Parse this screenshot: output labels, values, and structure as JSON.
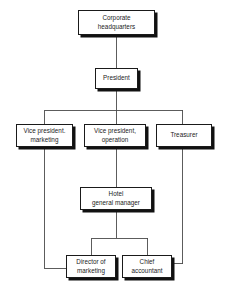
{
  "diagram": {
    "type": "org-chart",
    "background_color": "#ffffff",
    "box_fill_color": "#ffffff",
    "box_border_color": "#1a1a1a",
    "shadow_color": "#111111",
    "connector_color": "#4a4a4a",
    "text_color": "#1b1b1b"
  },
  "nodes": {
    "corporate_hq": {
      "label": "Corporate\nheadquarters",
      "level": 1
    },
    "president": {
      "label": "President",
      "level": 2
    },
    "vp_marketing": {
      "label": "Vice president.\nmarketing",
      "level": 3
    },
    "vp_operation": {
      "label": "Vice president,\noperation",
      "level": 3
    },
    "treasurer": {
      "label": "Treasurer",
      "level": 3
    },
    "hotel_general_manager": {
      "label": "Hotel\ngeneral manager",
      "level": 4
    },
    "director_of_marketing": {
      "label": "Director of\nmarketing",
      "level": 5
    },
    "chief_accountant": {
      "label": "Chief\naccountant",
      "level": 5
    }
  },
  "edges": [
    {
      "from": "corporate_hq",
      "to": "president"
    },
    {
      "from": "president",
      "to": "vp_marketing"
    },
    {
      "from": "president",
      "to": "vp_operation"
    },
    {
      "from": "president",
      "to": "treasurer"
    },
    {
      "from": "vp_operation",
      "to": "hotel_general_manager"
    },
    {
      "from": "hotel_general_manager",
      "to": "director_of_marketing"
    },
    {
      "from": "hotel_general_manager",
      "to": "chief_accountant"
    },
    {
      "from": "vp_marketing",
      "to": "director_of_marketing"
    },
    {
      "from": "treasurer",
      "to": "chief_accountant"
    }
  ]
}
